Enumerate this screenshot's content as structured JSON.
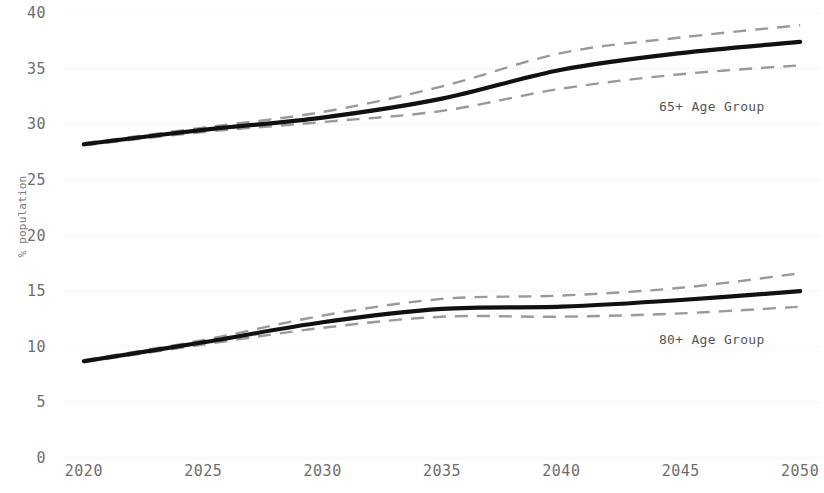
{
  "chart_data": {
    "type": "line",
    "title": "",
    "subtitle": "",
    "xlabel": "",
    "ylabel": "% population",
    "x": [
      2020,
      2025,
      2030,
      2035,
      2040,
      2045,
      2050
    ],
    "xticklabels": [
      "2020",
      "2025",
      "2030",
      "2035",
      "2040",
      "2045",
      "2050"
    ],
    "yticklabels": [
      "0",
      "5",
      "10",
      "15",
      "20",
      "25",
      "30",
      "35",
      "40"
    ],
    "yticks": [
      0,
      5,
      10,
      15,
      20,
      25,
      30,
      35,
      40
    ],
    "xlim": [
      2019,
      2051
    ],
    "ylim": [
      0,
      40
    ],
    "grid": "horizontal-dotted",
    "legend_position": "inline-right",
    "series": [
      {
        "name": "65+ Age Group",
        "style": "solid",
        "color": "#111111",
        "values": [
          28.2,
          29.5,
          30.6,
          32.3,
          34.9,
          36.4,
          37.4
        ]
      },
      {
        "name": "65+ Age Group upper bound",
        "style": "dashed",
        "color": "#9a9a9a",
        "values": [
          28.3,
          29.7,
          31.1,
          33.4,
          36.4,
          37.8,
          38.9
        ]
      },
      {
        "name": "65+ Age Group lower bound",
        "style": "dashed",
        "color": "#9a9a9a",
        "values": [
          28.1,
          29.3,
          30.2,
          31.2,
          33.2,
          34.5,
          35.3
        ]
      },
      {
        "name": "80+ Age Group",
        "style": "solid",
        "color": "#111111",
        "values": [
          8.7,
          10.4,
          12.2,
          13.4,
          13.6,
          14.2,
          15.0
        ]
      },
      {
        "name": "80+ Age Group upper bound",
        "style": "dashed",
        "color": "#9a9a9a",
        "values": [
          8.8,
          10.6,
          12.8,
          14.3,
          14.6,
          15.3,
          16.6
        ]
      },
      {
        "name": "80+ Age Group lower bound",
        "style": "dashed",
        "color": "#9a9a9a",
        "values": [
          8.6,
          10.2,
          11.7,
          12.7,
          12.7,
          13.0,
          13.6
        ]
      }
    ],
    "annotations": [
      {
        "text": "65+ Age Group",
        "x": 2046.3,
        "y": 31.6
      },
      {
        "text": "80+ Age Group",
        "x": 2046.3,
        "y": 10.7
      }
    ],
    "colors": {
      "line": "#111111",
      "band": "#9a9a9a",
      "grid": "#dddddd",
      "tick_text": "#6e6e6e",
      "axis_label": "#7a7a7a",
      "annotation": "#555555",
      "background": "#ffffff"
    }
  }
}
